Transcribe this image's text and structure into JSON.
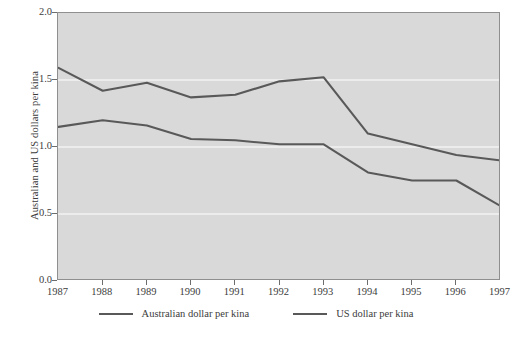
{
  "chart_data": {
    "type": "line",
    "title": "",
    "xlabel": "",
    "ylabel": "Australian and US dollars per kina",
    "x": [
      1987,
      1988,
      1989,
      1990,
      1991,
      1992,
      1993,
      1994,
      1995,
      1996,
      1997
    ],
    "xtick_labels": [
      "1987",
      "1988",
      "1989",
      "1990",
      "1991",
      "1992",
      "1993",
      "1994",
      "1995",
      "1996",
      "1997"
    ],
    "ytick_labels": [
      "0.0",
      "0.5",
      "1.0",
      "1.5",
      "2.0"
    ],
    "ytick_values": [
      0.0,
      0.5,
      1.0,
      1.5,
      2.0
    ],
    "ylim": [
      0.0,
      2.0
    ],
    "xlim": [
      1987,
      1997
    ],
    "grid": "horizontal-white",
    "legend_position": "bottom-center",
    "series": [
      {
        "name": "Australian dollar per kina",
        "color": "#595959",
        "values": [
          1.59,
          1.42,
          1.48,
          1.37,
          1.39,
          1.49,
          1.52,
          1.1,
          1.02,
          0.94,
          0.9
        ]
      },
      {
        "name": "US dollar per kina",
        "color": "#595959",
        "values": [
          1.15,
          1.2,
          1.16,
          1.06,
          1.05,
          1.02,
          1.02,
          0.81,
          0.75,
          0.75,
          0.56
        ]
      }
    ],
    "plot_background": "#d9d9d9",
    "gridline_color": "#f2f2f2",
    "axis_color": "#8f8f8f"
  }
}
